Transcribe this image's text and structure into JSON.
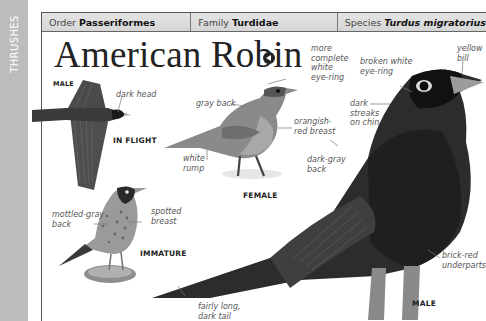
{
  "section_tab": "THRUSHES",
  "taxonomy": {
    "order_label": "Order",
    "order_value": "Passeriformes",
    "family_label": "Family",
    "family_value": "Turdidae",
    "species_label": "Species",
    "species_value": "Turdus migratorius"
  },
  "title": "American Robin",
  "audio_icon": "speaker-icon",
  "figures": {
    "flight": {
      "sex_tag": "MALE",
      "view_tag": "IN FLIGHT",
      "notes": {
        "head": "dark head"
      }
    },
    "female": {
      "tag": "FEMALE",
      "notes": {
        "eye_ring": "more\ncomplete\nwhite\neye-ring",
        "back": "gray back",
        "breast": "orangish-\nred breast",
        "rump": "white\nrump"
      }
    },
    "immature": {
      "tag": "IMMATURE",
      "notes": {
        "back": "mottled-gray\nback",
        "breast": "spotted\nbreast"
      }
    },
    "male": {
      "tag": "MALE",
      "notes": {
        "eye_ring": "broken white\neye-ring",
        "bill": "yellow\nbill",
        "chin": "dark\nstreaks\non chin",
        "back": "dark-gray\nback",
        "underparts": "brick-red\nunderparts",
        "tail": "fairly long,\ndark tail"
      }
    }
  },
  "colors": {
    "side_tab": "#bcbcbc",
    "header_bar": "#dcdcdc",
    "frame_line": "#555555",
    "note_text": "#555555"
  }
}
